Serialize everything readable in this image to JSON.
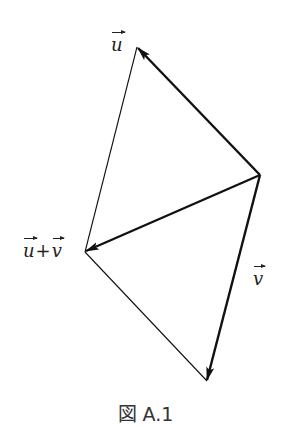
{
  "figure": {
    "caption": "図 A.1",
    "labels": {
      "u": "u",
      "v": "v",
      "sum_u": "u",
      "sum_plus": "+",
      "sum_v": "v"
    },
    "colors": {
      "stroke": "#111111",
      "background": "#ffffff"
    },
    "points": {
      "origin": [
        260,
        175
      ],
      "u_tip": [
        137,
        47
      ],
      "v_tip": [
        207,
        381
      ],
      "sum_tip": [
        85,
        252
      ]
    },
    "vectors": [
      {
        "name": "u",
        "from": "origin",
        "to": "u_tip",
        "arrow": true
      },
      {
        "name": "v",
        "from": "origin",
        "to": "v_tip",
        "arrow": true
      },
      {
        "name": "u+v",
        "from": "origin",
        "to": "sum_tip",
        "arrow": true
      }
    ],
    "parallelogram_edges": [
      {
        "from": "u_tip",
        "to": "sum_tip"
      },
      {
        "from": "sum_tip",
        "to": "v_tip"
      }
    ]
  }
}
